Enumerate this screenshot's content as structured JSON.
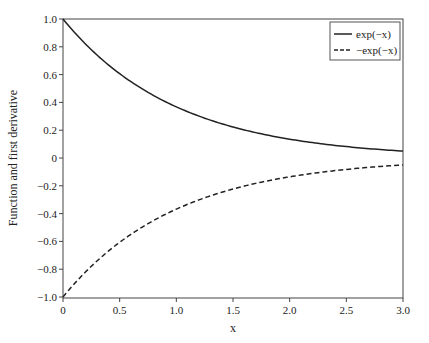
{
  "chart_data": {
    "type": "line",
    "title": "",
    "xlabel": "x",
    "ylabel": "Function and first derivative",
    "xlim": [
      0,
      3.0
    ],
    "ylim": [
      -1.0,
      1.0
    ],
    "xticks": [
      "0",
      "0.5",
      "1.0",
      "1.5",
      "2.0",
      "2.5",
      "3.0"
    ],
    "yticks": [
      "1.0",
      "0.8",
      "0.6",
      "0.4",
      "0.2",
      "0",
      "−0.2",
      "−0.4",
      "−0.6",
      "−0.8",
      "−1.0"
    ],
    "legend_position": "upper right",
    "grid": false,
    "series": [
      {
        "name": "exp(−x)",
        "style": "solid",
        "x": [
          0,
          0.25,
          0.5,
          0.75,
          1.0,
          1.25,
          1.5,
          1.75,
          2.0,
          2.25,
          2.5,
          2.75,
          3.0
        ],
        "values": [
          1.0,
          0.779,
          0.607,
          0.472,
          0.368,
          0.287,
          0.223,
          0.174,
          0.135,
          0.105,
          0.082,
          0.064,
          0.05
        ]
      },
      {
        "name": "−exp(−x)",
        "style": "dashed",
        "x": [
          0,
          0.25,
          0.5,
          0.75,
          1.0,
          1.25,
          1.5,
          1.75,
          2.0,
          2.25,
          2.5,
          2.75,
          3.0
        ],
        "values": [
          -1.0,
          -0.779,
          -0.607,
          -0.472,
          -0.368,
          -0.287,
          -0.223,
          -0.174,
          -0.135,
          -0.105,
          -0.082,
          -0.064,
          -0.05
        ]
      }
    ]
  }
}
